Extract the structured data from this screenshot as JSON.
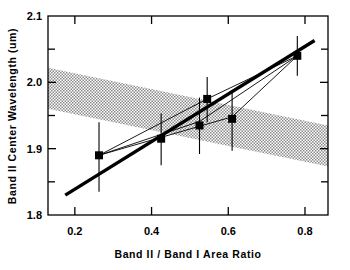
{
  "chart_data": {
    "type": "scatter",
    "title": "",
    "xlabel": "Band II / Band I Area Ratio",
    "ylabel": "Band II Center Wavelength (um)",
    "xlim": [
      0.13,
      0.86
    ],
    "ylim": [
      1.8,
      2.1
    ],
    "grid": false,
    "legend": "none",
    "xticks": [
      0.2,
      0.4,
      0.6,
      0.8
    ],
    "xtick_labels": [
      "0.2",
      "0.4",
      "0.6",
      "0.8"
    ],
    "yticks": [
      1.8,
      1.9,
      2.0,
      2.1
    ],
    "ytick_labels": [
      "1.8",
      "1.9",
      "2.0",
      "2.1"
    ],
    "y_minor_ticks": [
      1.85,
      1.95,
      2.05
    ],
    "marker": "filled-square",
    "points": [
      {
        "x": 0.263,
        "y": 1.89,
        "yerr_low": 0.055,
        "yerr_high": 0.05
      },
      {
        "x": 0.425,
        "y": 1.915,
        "yerr_low": 0.04,
        "yerr_high": 0.038
      },
      {
        "x": 0.525,
        "y": 1.935,
        "yerr_low": 0.043,
        "yerr_high": 0.042
      },
      {
        "x": 0.545,
        "y": 1.975,
        "yerr_low": 0.035,
        "yerr_high": 0.033
      },
      {
        "x": 0.61,
        "y": 1.945,
        "yerr_low": 0.048,
        "yerr_high": 0.04
      },
      {
        "x": 0.78,
        "y": 2.04,
        "yerr_low": 0.03,
        "yerr_high": 0.03
      }
    ],
    "series": [
      {
        "name": "best-fit-line",
        "style": "thick-solid",
        "x": [
          0.175,
          0.825
        ],
        "y": [
          1.83,
          2.063
        ]
      },
      {
        "name": "fit-line-upper",
        "style": "thin-solid",
        "x": [
          0.263,
          0.545,
          0.78
        ],
        "y": [
          1.89,
          1.975,
          2.04
        ]
      },
      {
        "name": "fit-line-lower",
        "style": "thin-solid",
        "x": [
          0.263,
          0.525,
          0.78
        ],
        "y": [
          1.89,
          1.941,
          2.04
        ]
      },
      {
        "name": "fit-line-mid",
        "style": "thin-solid",
        "x": [
          0.263,
          0.61,
          0.78
        ],
        "y": [
          1.89,
          1.948,
          2.04
        ]
      }
    ],
    "shaded_band": {
      "name": "stippled-band",
      "description": "hatched/stippled band sloping gently downward to the right",
      "x_left": 0.13,
      "x_right": 0.86,
      "y_left_top": 2.022,
      "y_left_bottom": 1.96,
      "y_right_top": 1.935,
      "y_right_bottom": 1.873
    }
  },
  "colors": {
    "axis": "#000000",
    "marker": "#000000",
    "thick_line": "#000000",
    "thin_line": "#000000",
    "band_fill": "#8c8c8c",
    "background": "#ffffff"
  }
}
